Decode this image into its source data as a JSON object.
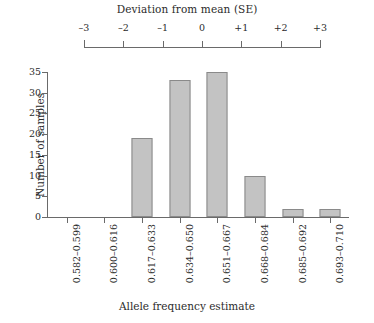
{
  "chart_data": {
    "type": "bar",
    "title": "",
    "xlabel": "Allele frequency estimate",
    "ylabel": "Number of samples",
    "categories": [
      "0.582–0.599",
      "0.600–0.616",
      "0.617–0.633",
      "0.634–0.650",
      "0.651–0.667",
      "0.668–0.684",
      "0.685–0.692",
      "0.693–0.710"
    ],
    "values": [
      0,
      0,
      19,
      33,
      35,
      10,
      2,
      2
    ],
    "ylim": [
      0,
      35
    ],
    "yticks": [
      0,
      5,
      10,
      15,
      20,
      25,
      30,
      35
    ],
    "ytick_labels": [
      "0",
      "5",
      "10",
      "15",
      "20",
      "25",
      "30",
      "35"
    ],
    "grid": false,
    "legend": null,
    "bar_color": "#c3c3c3",
    "bar_edge_color": "#8a8a8a",
    "axis_color": "#6a6a6a",
    "secondary_axis": {
      "label": "Deviation from mean (SE)",
      "position": "top",
      "ticks": [
        -3,
        -2,
        -1,
        0,
        1,
        2,
        3
      ],
      "tick_labels": [
        "–3",
        "–2",
        "–1",
        "0",
        "+1",
        "+2",
        "+3"
      ]
    }
  }
}
